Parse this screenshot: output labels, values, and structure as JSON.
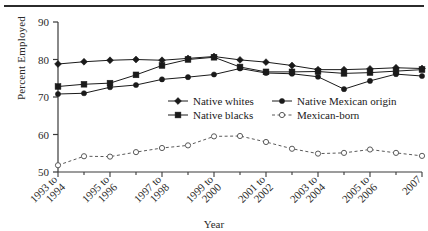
{
  "figure": {
    "y_axis_title": "Percent Employed",
    "x_axis_title": "Year"
  },
  "chart_data": {
    "type": "line",
    "title": "",
    "xlabel": "Year",
    "ylabel": "Percent Employed",
    "ylim": [
      50,
      90
    ],
    "yticks": [
      50,
      60,
      70,
      80,
      90
    ],
    "grid": false,
    "legend_position": "inside-center",
    "x": [
      "1993",
      "1994",
      "1995",
      "1996",
      "1997",
      "1998",
      "1999",
      "2000",
      "2001",
      "2002",
      "2003",
      "2004",
      "2005",
      "2006",
      "2007"
    ],
    "xtick_labels": [
      "1993 to 1994",
      "1995 to 1996",
      "1997 to 1998",
      "1999 to 2000",
      "2001 to 2002",
      "2003 to 2004",
      "2005 to 2006",
      "2007"
    ],
    "series": [
      {
        "name": "Native whites",
        "marker": "filled-diamond",
        "linestyle": "solid",
        "values": [
          78.8,
          79.4,
          79.8,
          80.0,
          79.8,
          80.3,
          80.8,
          79.9,
          79.3,
          78.4,
          77.3,
          77.3,
          77.5,
          77.8,
          77.6
        ]
      },
      {
        "name": "Native Mexican origin",
        "marker": "filled-circle",
        "linestyle": "solid",
        "values": [
          70.8,
          71.0,
          72.6,
          73.2,
          74.7,
          75.3,
          76.0,
          77.6,
          76.4,
          76.2,
          75.4,
          72.1,
          74.3,
          76.1,
          75.6
        ]
      },
      {
        "name": "Native blacks",
        "marker": "filled-square",
        "linestyle": "solid",
        "values": [
          72.8,
          73.4,
          73.7,
          75.9,
          78.4,
          80.0,
          80.6,
          78.0,
          76.7,
          76.7,
          76.8,
          76.3,
          76.5,
          76.9,
          77.3
        ]
      },
      {
        "name": "Mexican-born",
        "marker": "open-circle",
        "linestyle": "dashed",
        "values": [
          51.8,
          54.2,
          54.1,
          55.3,
          56.4,
          57.1,
          59.5,
          59.6,
          58.0,
          56.2,
          54.9,
          55.1,
          56.0,
          55.1,
          54.3
        ]
      }
    ]
  },
  "legend": {
    "entries": [
      {
        "label": "Native whites",
        "marker": "filled-diamond",
        "linestyle": "solid"
      },
      {
        "label": "Native Mexican origin",
        "marker": "filled-circle",
        "linestyle": "solid"
      },
      {
        "label": "Native blacks",
        "marker": "filled-square",
        "linestyle": "solid"
      },
      {
        "label": "Mexican-born",
        "marker": "open-circle",
        "linestyle": "dashed"
      }
    ]
  },
  "colors": {
    "line": "#1a1a1a",
    "axis": "#3a3a3a",
    "dashed_line": "#5a5a5a",
    "text": "#2a2a2a",
    "rule": "#2b2b2b"
  }
}
